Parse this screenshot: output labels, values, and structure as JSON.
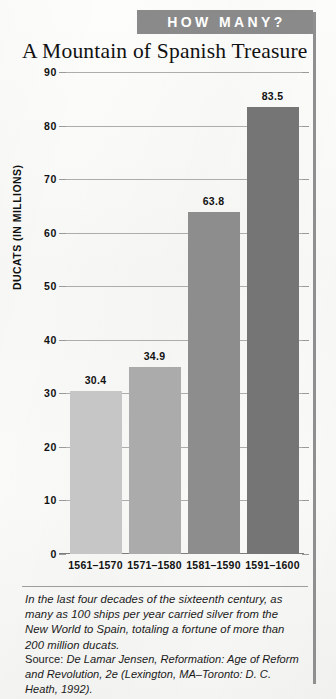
{
  "banner": {
    "label": "HOW MANY?",
    "background_color": "#8a8a8a",
    "text_color": "#ffffff"
  },
  "chart_data": {
    "type": "bar",
    "title": "A Mountain of Spanish Treasure",
    "xlabel": "",
    "ylabel": "DUCATS (IN MILLIONS)",
    "categories": [
      "1561–1570",
      "1571–1580",
      "1581–1590",
      "1591–1600"
    ],
    "values": [
      30.4,
      34.9,
      63.8,
      83.5
    ],
    "value_labels": [
      "30.4",
      "34.9",
      "63.8",
      "83.5"
    ],
    "bar_colors": [
      "#c6c6c6",
      "#ababab",
      "#8d8d8d",
      "#757575"
    ],
    "ylim": [
      0,
      90
    ],
    "yticks": [
      0,
      10,
      20,
      30,
      40,
      50,
      60,
      70,
      80,
      90
    ],
    "ytick_labels": [
      "0",
      "10",
      "20",
      "30",
      "40",
      "50",
      "60",
      "70",
      "80",
      "90"
    ],
    "grid": true,
    "legend": false
  },
  "caption": {
    "text": "In the last four decades of the sixteenth century, as many as 100 ships per year carried silver from the New World to Spain, totaling a fortune of more than 200 million ducats."
  },
  "source": {
    "prefix": "Source: ",
    "author": "De Lamar Jensen, ",
    "work_title": "Reformation: Age of Reform and Revolution, 2e",
    "publication": " (Lexington, MA–Toronto: D. C. Heath, 1992)."
  }
}
